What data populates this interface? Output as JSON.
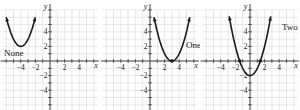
{
  "chart_data": [
    {
      "type": "line",
      "title": "",
      "function": "y = (x + 4)^2 + 2",
      "annotation": "None",
      "xlabel": "x",
      "ylabel": "y",
      "xlim": [
        -6.5,
        6.5
      ],
      "ylim": [
        -7,
        7
      ],
      "x_ticks": [
        -4,
        -2,
        2,
        4
      ],
      "y_ticks": [
        4,
        2,
        -2,
        -4
      ],
      "grid": true,
      "vertex": [
        -4,
        2
      ],
      "x_intercepts": []
    },
    {
      "type": "line",
      "title": "",
      "function": "y = (x - 3)^2",
      "annotation": "One",
      "xlabel": "x",
      "ylabel": "y",
      "xlim": [
        -6.5,
        6.5
      ],
      "ylim": [
        -7,
        7
      ],
      "x_ticks": [
        -4,
        -2,
        2,
        4
      ],
      "y_ticks": [
        4,
        2,
        -2,
        -4
      ],
      "grid": true,
      "vertex": [
        3,
        0
      ],
      "x_intercepts": [
        3
      ]
    },
    {
      "type": "line",
      "title": "",
      "function": "y = x^2 - 2",
      "annotation": "Two",
      "xlabel": "x",
      "ylabel": "y",
      "xlim": [
        -6.5,
        6.5
      ],
      "ylim": [
        -7,
        7
      ],
      "x_ticks": [
        -4,
        -2,
        2,
        4
      ],
      "y_ticks": [
        4,
        2,
        -2,
        -4
      ],
      "grid": true,
      "vertex": [
        0,
        -2
      ],
      "x_intercepts": [
        -1.41,
        1.41
      ]
    }
  ],
  "panels": [
    {
      "annotation": "None",
      "xlabel": "x",
      "ylabel": "y",
      "x_tick_labels": [
        "−4",
        "−2",
        "2",
        "4"
      ],
      "y_tick_labels": [
        "4",
        "2",
        "−2",
        "−4"
      ]
    },
    {
      "annotation": "One",
      "xlabel": "x",
      "ylabel": "y",
      "x_tick_labels": [
        "−4",
        "−2",
        "2",
        "4"
      ],
      "y_tick_labels": [
        "4",
        "2",
        "−2",
        "−4"
      ]
    },
    {
      "annotation": "Two",
      "xlabel": "x",
      "ylabel": "y",
      "x_tick_labels": [
        "−4",
        "−2",
        "2",
        "4"
      ],
      "y_tick_labels": [
        "4",
        "2",
        "−2",
        "−4"
      ]
    }
  ]
}
